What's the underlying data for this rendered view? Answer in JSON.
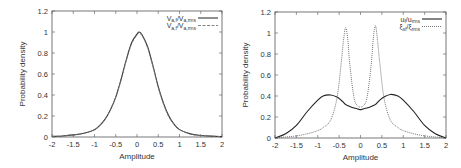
{
  "chart_data": [
    {
      "type": "line",
      "title": "",
      "xlabel": "Amplitude",
      "ylabel": "Probability density",
      "xlim": [
        -2,
        2
      ],
      "ylim": [
        0,
        1.2
      ],
      "xticks": [
        -2,
        -1.5,
        -1,
        -0.5,
        0,
        0.5,
        1,
        1.5,
        2
      ],
      "xtick_labels": [
        "-2",
        "-1.5",
        "-1",
        "-0.5",
        "0",
        "0.5",
        "1",
        "1.5",
        "2"
      ],
      "yticks": [
        0,
        0.2,
        0.4,
        0.6,
        0.8,
        1,
        1.2
      ],
      "ytick_labels": [
        "0",
        "0.2",
        "0.4",
        "0.6",
        "0.8",
        "1",
        "1.2"
      ],
      "grid": false,
      "legend_position": "top-right",
      "x": [
        -2,
        -1.75,
        -1.5,
        -1.25,
        -1,
        -0.875,
        -0.75,
        -0.625,
        -0.5,
        -0.375,
        -0.25,
        -0.125,
        0,
        0.05,
        0.125,
        0.25,
        0.375,
        0.5,
        0.625,
        0.75,
        0.875,
        1,
        1.25,
        1.5,
        1.75,
        2
      ],
      "series": [
        {
          "name": "v_{a,f}/v_{a,rms}",
          "legend_main": "V",
          "legend_sub1": "a,f",
          "legend_mid": "/V",
          "legend_sub2": "a,rms",
          "style": "solid",
          "color": "#333333",
          "values": [
            0.005,
            0.01,
            0.02,
            0.035,
            0.07,
            0.11,
            0.17,
            0.26,
            0.38,
            0.55,
            0.74,
            0.9,
            0.98,
            1.0,
            0.97,
            0.86,
            0.68,
            0.48,
            0.32,
            0.2,
            0.12,
            0.07,
            0.03,
            0.015,
            0.008,
            0.004
          ]
        },
        {
          "name": "v_{a,f}/v_{a,rms}",
          "legend_main": "V",
          "legend_sub1": "a,f",
          "legend_mid": "/V",
          "legend_sub2": "a,rms",
          "style": "dashed",
          "color": "#777777",
          "values": [
            0.005,
            0.01,
            0.02,
            0.035,
            0.07,
            0.11,
            0.17,
            0.26,
            0.38,
            0.54,
            0.73,
            0.89,
            0.97,
            0.99,
            0.96,
            0.85,
            0.67,
            0.47,
            0.31,
            0.19,
            0.12,
            0.07,
            0.03,
            0.015,
            0.008,
            0.004
          ]
        }
      ]
    },
    {
      "type": "line",
      "title": "",
      "xlabel": "Amplitude",
      "ylabel": "Probability density",
      "xlim": [
        -2,
        2
      ],
      "ylim": [
        0,
        1.2
      ],
      "xticks": [
        -2,
        -1.5,
        -1,
        -0.5,
        0,
        0.5,
        1,
        1.5,
        2
      ],
      "xtick_labels": [
        "-2",
        "-1.5",
        "-1",
        "-0.5",
        "0",
        "0.5",
        "1",
        "1.5",
        "2"
      ],
      "yticks": [
        0,
        0.2,
        0.4,
        0.6,
        0.8,
        1,
        1.2
      ],
      "ytick_labels": [
        "0",
        "0.2",
        "0.4",
        "0.6",
        "0.8",
        "1",
        "1.2"
      ],
      "grid": false,
      "legend_position": "top-right",
      "x": [
        -2,
        -1.75,
        -1.5,
        -1.25,
        -1,
        -0.875,
        -0.7,
        -0.55,
        -0.45,
        -0.4,
        -0.35,
        -0.3,
        -0.25,
        -0.15,
        -0.05,
        0,
        0.05,
        0.15,
        0.25,
        0.3,
        0.35,
        0.4,
        0.45,
        0.55,
        0.7,
        0.875,
        1,
        1.25,
        1.5,
        1.75,
        2
      ],
      "series": [
        {
          "name": "u_f/u_rms",
          "legend_main": "u",
          "legend_sub1": "f",
          "legend_mid": "/u",
          "legend_sub2": "rms",
          "style": "solid",
          "color": "#222222",
          "values": [
            0.0,
            0.04,
            0.12,
            0.25,
            0.36,
            0.4,
            0.41,
            0.39,
            0.36,
            0.34,
            0.32,
            0.31,
            0.3,
            0.285,
            0.275,
            0.27,
            0.275,
            0.285,
            0.3,
            0.31,
            0.32,
            0.34,
            0.36,
            0.39,
            0.415,
            0.4,
            0.36,
            0.25,
            0.12,
            0.04,
            0.0
          ]
        },
        {
          "name": "xi_sf/xi_rms",
          "legend_main": "ξ",
          "legend_sub1": "sf",
          "legend_mid": "/ξ",
          "legend_sub2": "rms",
          "style": "dotted",
          "color": "#666666",
          "values": [
            0.0,
            0.01,
            0.02,
            0.04,
            0.07,
            0.1,
            0.17,
            0.38,
            0.72,
            0.92,
            1.05,
            0.95,
            0.7,
            0.38,
            0.3,
            0.3,
            0.3,
            0.38,
            0.7,
            0.95,
            1.07,
            0.92,
            0.72,
            0.38,
            0.17,
            0.1,
            0.07,
            0.04,
            0.02,
            0.01,
            0.0
          ]
        }
      ]
    }
  ],
  "panels": [
    {
      "xlabel": "Amplitude",
      "ylabel": "Probability density"
    },
    {
      "xlabel": "Amplitude",
      "ylabel": "Probability density"
    }
  ]
}
